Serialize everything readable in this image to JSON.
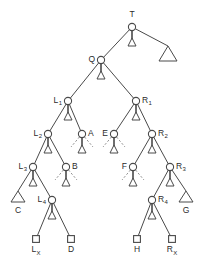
{
  "figure": {
    "name": "binary-tree-diagram",
    "colors": {
      "edge": "#4a4a4a",
      "node_stroke": "#4a4a4a",
      "node_fill": "#ffffff",
      "label": "#2b2b2b",
      "dashed_edge": "#8a8a8a",
      "background": "#ffffff"
    }
  },
  "nodes": [
    {
      "id": "T",
      "label": "T",
      "sub": "",
      "shape": "circle",
      "x": 132,
      "y": 27,
      "label_pos": "above"
    },
    {
      "id": "Q",
      "label": "Q",
      "sub": "",
      "shape": "circle",
      "x": 101,
      "y": 60,
      "label_pos": "left"
    },
    {
      "id": "L1",
      "label": "L",
      "sub": "1",
      "shape": "circle",
      "x": 68,
      "y": 101,
      "label_pos": "left"
    },
    {
      "id": "R1",
      "label": "R",
      "sub": "1",
      "shape": "circle",
      "x": 136,
      "y": 101,
      "label_pos": "right"
    },
    {
      "id": "L2",
      "label": "L",
      "sub": "2",
      "shape": "circle",
      "x": 48,
      "y": 134,
      "label_pos": "left"
    },
    {
      "id": "A",
      "label": "A",
      "sub": "",
      "shape": "circle",
      "x": 82,
      "y": 134,
      "label_pos": "right"
    },
    {
      "id": "E",
      "label": "E",
      "sub": "",
      "shape": "circle",
      "x": 114,
      "y": 134,
      "label_pos": "left"
    },
    {
      "id": "R2",
      "label": "R",
      "sub": "2",
      "shape": "circle",
      "x": 152,
      "y": 134,
      "label_pos": "right"
    },
    {
      "id": "L3",
      "label": "L",
      "sub": "3",
      "shape": "circle",
      "x": 33,
      "y": 167,
      "label_pos": "left"
    },
    {
      "id": "B",
      "label": "B",
      "sub": "",
      "shape": "circle",
      "x": 66,
      "y": 167,
      "label_pos": "right"
    },
    {
      "id": "F",
      "label": "F",
      "sub": "",
      "shape": "circle",
      "x": 133,
      "y": 167,
      "label_pos": "left"
    },
    {
      "id": "R3",
      "label": "R",
      "sub": "3",
      "shape": "circle",
      "x": 170,
      "y": 167,
      "label_pos": "right"
    },
    {
      "id": "L4",
      "label": "L",
      "sub": "4",
      "shape": "circle",
      "x": 52,
      "y": 200,
      "label_pos": "left"
    },
    {
      "id": "R4",
      "label": "R",
      "sub": "4",
      "shape": "circle",
      "x": 152,
      "y": 200,
      "label_pos": "right"
    },
    {
      "id": "LX",
      "label": "L",
      "sub": "X",
      "shape": "square",
      "x": 36,
      "y": 239,
      "label_pos": "below"
    },
    {
      "id": "D",
      "label": "D",
      "sub": "",
      "shape": "square",
      "x": 71,
      "y": 239,
      "label_pos": "below"
    },
    {
      "id": "H",
      "label": "H",
      "sub": "",
      "shape": "square",
      "x": 137,
      "y": 239,
      "label_pos": "below"
    },
    {
      "id": "RX",
      "label": "R",
      "sub": "X",
      "shape": "square",
      "x": 172,
      "y": 239,
      "label_pos": "below"
    }
  ],
  "triangle_leaves": [
    {
      "id": "bigT",
      "label": "",
      "x": 168,
      "y": 55,
      "size": "large",
      "label_pos": "none"
    },
    {
      "id": "C",
      "label": "C",
      "x": 18,
      "y": 200,
      "size": "small",
      "label_pos": "below"
    },
    {
      "id": "G",
      "label": "G",
      "x": 186,
      "y": 200,
      "size": "small",
      "label_pos": "below"
    }
  ],
  "subtree_stubs": [
    {
      "parent": "T",
      "x": 132,
      "y": 27
    },
    {
      "parent": "Q",
      "x": 101,
      "y": 60
    },
    {
      "parent": "L1",
      "x": 68,
      "y": 101
    },
    {
      "parent": "R1",
      "x": 136,
      "y": 101
    },
    {
      "parent": "L2",
      "x": 48,
      "y": 134
    },
    {
      "parent": "A",
      "x": 82,
      "y": 134
    },
    {
      "parent": "E",
      "x": 114,
      "y": 134
    },
    {
      "parent": "R2",
      "x": 152,
      "y": 134
    },
    {
      "parent": "L3",
      "x": 33,
      "y": 167
    },
    {
      "parent": "B",
      "x": 66,
      "y": 167
    },
    {
      "parent": "F",
      "x": 133,
      "y": 167
    },
    {
      "parent": "R3",
      "x": 170,
      "y": 167
    },
    {
      "parent": "L4",
      "x": 52,
      "y": 200
    },
    {
      "parent": "R4",
      "x": 152,
      "y": 200
    }
  ],
  "edges": [
    {
      "from": "T",
      "to": "Q"
    },
    {
      "from": "Q",
      "to": "L1"
    },
    {
      "from": "Q",
      "to": "R1"
    },
    {
      "from": "L1",
      "to": "L2"
    },
    {
      "from": "L1",
      "to": "A"
    },
    {
      "from": "R1",
      "to": "E"
    },
    {
      "from": "R1",
      "to": "R2"
    },
    {
      "from": "L2",
      "to": "L3"
    },
    {
      "from": "L2",
      "to": "B"
    },
    {
      "from": "R2",
      "to": "F"
    },
    {
      "from": "R2",
      "to": "R3"
    },
    {
      "from": "L3",
      "to": "C"
    },
    {
      "from": "L3",
      "to": "L4"
    },
    {
      "from": "R3",
      "to": "R4"
    },
    {
      "from": "R3",
      "to": "G"
    },
    {
      "from": "L4",
      "to": "LX"
    },
    {
      "from": "L4",
      "to": "D"
    },
    {
      "from": "R4",
      "to": "H"
    },
    {
      "from": "R4",
      "to": "RX"
    },
    {
      "from": "T",
      "to": "bigT"
    }
  ],
  "dashed_stub_nodes": [
    "A",
    "E",
    "B",
    "F"
  ]
}
